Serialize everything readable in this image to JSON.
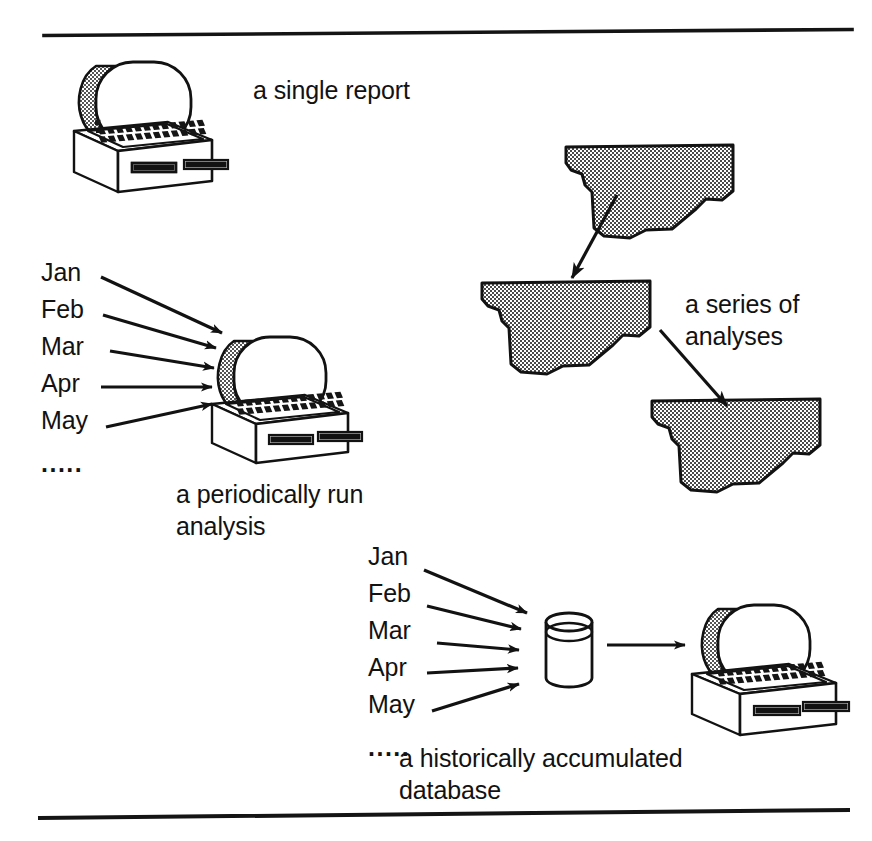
{
  "figure": {
    "kind": "diagram",
    "background_color": "#ffffff",
    "ink_color": "#121212",
    "report_fill_color": "#8a8a8a",
    "screen_shade_color": "#9a9a9a",
    "rules": {
      "top_rule": "horizontal-rule",
      "bottom_rule": "horizontal-rule"
    }
  },
  "groups": {
    "single_report": {
      "caption": "a single report",
      "icon": "desktop-computer-icon"
    },
    "periodic_analysis": {
      "months": [
        "Jan",
        "Feb",
        "Mar",
        "Apr",
        "May"
      ],
      "ellipsis": ".....",
      "caption_line1": "a periodically run",
      "caption_line2": "analysis",
      "icon": "desktop-computer-icon",
      "arrow_count": 5
    },
    "series_of_analyses": {
      "caption_line1": "a series of",
      "caption_line2": "analyses",
      "report_count": 3,
      "arrow_count": 2,
      "icon": "report-page-icon"
    },
    "historical_database": {
      "months": [
        "Jan",
        "Feb",
        "Mar",
        "Apr",
        "May"
      ],
      "ellipsis": ".....",
      "caption_line1": "a historically accumulated",
      "caption_line2": "database",
      "database_icon": "cylinder-database-icon",
      "computer_icon": "desktop-computer-icon",
      "arrow_count": 6
    }
  }
}
